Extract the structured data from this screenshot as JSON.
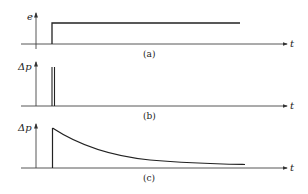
{
  "diagram": {
    "panels": [
      {
        "id": "a",
        "caption": "(a)",
        "y_label": "e",
        "x_label": "t",
        "signal": "step",
        "description": "Step input starting at t0 and holding constant"
      },
      {
        "id": "b",
        "caption": "(b)",
        "y_label": "Δp",
        "x_label": "t",
        "signal": "impulse",
        "description": "Narrow impulse (double spike) at t0"
      },
      {
        "id": "c",
        "caption": "(c)",
        "y_label": "Δp",
        "x_label": "t",
        "signal": "exponential-decay",
        "description": "Jump at t0 followed by exponential decay toward zero"
      }
    ],
    "colors": {
      "line": "#222222",
      "axis": "#444444",
      "background": "#ffffff"
    }
  }
}
